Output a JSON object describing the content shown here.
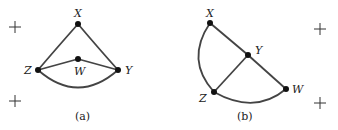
{
  "figure_a": {
    "caption": "(a)",
    "nodes": {
      "X": "X",
      "Y": "Y",
      "Z": "Z",
      "W": "W"
    },
    "edges": [
      [
        "X",
        "Z"
      ],
      [
        "X",
        "Y"
      ],
      [
        "Z",
        "W"
      ],
      [
        "W",
        "Y"
      ],
      [
        "Z",
        "Y"
      ]
    ]
  },
  "figure_b": {
    "caption": "(b)",
    "nodes": {
      "X": "X",
      "Y": "Y",
      "Z": "Z",
      "W": "W"
    },
    "edges": [
      [
        "X",
        "Y"
      ],
      [
        "Y",
        "W"
      ],
      [
        "Y",
        "Z"
      ],
      [
        "X",
        "Z"
      ],
      [
        "Z",
        "W"
      ]
    ]
  },
  "marks": {
    "plus": "+"
  }
}
